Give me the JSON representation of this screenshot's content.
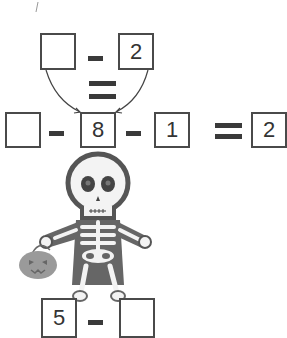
{
  "puzzle": {
    "top_equation": {
      "left": "",
      "operator": "-",
      "right": "2"
    },
    "middle_equals": "=",
    "main_equation": {
      "a": "",
      "op1": "-",
      "b": "8",
      "op2": "-",
      "c": "1",
      "equals": "=",
      "result": "2"
    },
    "bottom_equation": {
      "left": "5",
      "operator": "-",
      "right": ""
    }
  },
  "illustration": {
    "character": "skeleton-icon",
    "prop": "jack-o-lantern-bucket-icon"
  },
  "colors": {
    "line": "#4a4a4a",
    "skeleton_fill": "#666666",
    "pumpkin": "#9a9a9a"
  }
}
